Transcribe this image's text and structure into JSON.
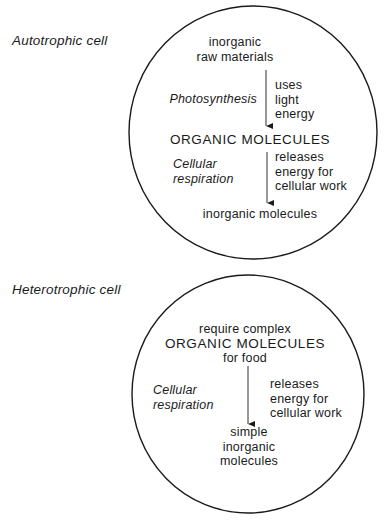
{
  "autotrophic": {
    "label": "Autotrophic cell",
    "input": [
      "inorganic",
      "raw materials"
    ],
    "process1": {
      "name": "Photosynthesis",
      "note": [
        "uses",
        "light",
        "energy"
      ]
    },
    "intermediate": "ORGANIC MOLECULES",
    "process2": {
      "name": [
        "Cellular",
        "respiration"
      ],
      "note": [
        "releases",
        "energy for",
        "cellular work"
      ]
    },
    "output": "inorganic molecules"
  },
  "heterotrophic": {
    "label": "Heterotrophic cell",
    "input": [
      "require complex",
      "ORGANIC MOLECULES",
      "for food"
    ],
    "process": {
      "name": [
        "Cellular",
        "respiration"
      ],
      "note": [
        "releases",
        "energy for",
        "cellular work"
      ]
    },
    "output": [
      "simple",
      "inorganic",
      "molecules"
    ]
  },
  "style": {
    "line_color": "#1a1a1a",
    "background": "#ffffff"
  }
}
